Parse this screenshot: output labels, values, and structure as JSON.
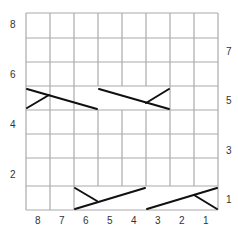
{
  "chart": {
    "columns": 8,
    "rows": 8,
    "row_labels_left": [
      "8",
      "6",
      "4",
      "2"
    ],
    "row_labels_right": [
      "7",
      "5",
      "3",
      "1"
    ],
    "column_labels": [
      "8",
      "7",
      "6",
      "5",
      "4",
      "3",
      "2",
      "1"
    ],
    "grid_color": "#aaaaaa",
    "line_color": "#111111"
  }
}
